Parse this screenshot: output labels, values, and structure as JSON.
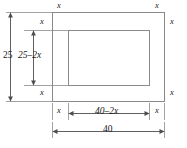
{
  "figure": {
    "type": "geometry-diagram",
    "outer_rect": {
      "width_label": "40",
      "height_label": "25"
    },
    "inner_rect": {
      "width_label": "40–2x",
      "height_label": "25–2x"
    },
    "margin_label": "x",
    "labels": {
      "margin_top_left": "x",
      "margin_top_right": "x",
      "margin_right_upper": "x",
      "margin_right_lower": "x",
      "margin_left_upper": "x",
      "margin_left_lower": "x",
      "margin_bottom_left": "x",
      "margin_bottom_right": "x",
      "height_outer": "25",
      "height_inner": "25–2x",
      "width_inner": "40–2x",
      "width_outer": "40"
    },
    "colors": {
      "stroke": "#7a7a7a",
      "dim_stroke": "#4d4d4d",
      "text": "#1a1a1a",
      "background": "#ffffff"
    }
  }
}
